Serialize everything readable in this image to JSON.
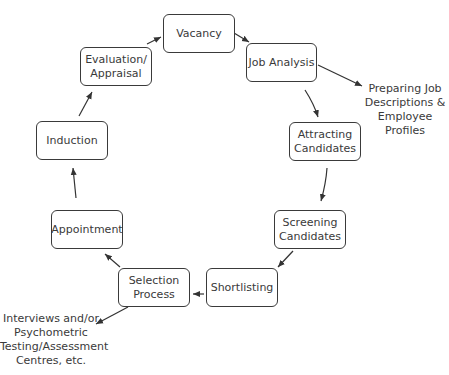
{
  "diagram": {
    "type": "cycle",
    "nodes": [
      {
        "id": "vacancy",
        "label": "Vacancy"
      },
      {
        "id": "job-analysis",
        "label": "Job Analysis"
      },
      {
        "id": "attracting-candidates",
        "label": "Attracting\nCandidates"
      },
      {
        "id": "screening-candidates",
        "label": "Screening\nCandidates"
      },
      {
        "id": "shortlisting",
        "label": "Shortlisting"
      },
      {
        "id": "selection-process",
        "label": "Selection\nProcess"
      },
      {
        "id": "appointment",
        "label": "Appointment"
      },
      {
        "id": "induction",
        "label": "Induction"
      },
      {
        "id": "evaluation-appraisal",
        "label": "Evaluation/\nAppraisal"
      }
    ],
    "notes": [
      {
        "id": "job-descriptions-note",
        "label": "Preparing Job\nDescriptions &\nEmployee\nProfiles",
        "attached_to": "job-analysis"
      },
      {
        "id": "selection-methods-note",
        "label": "Interviews and/or\nPsychometric\nTesting/Assessment\nCentres, etc.",
        "attached_to": "selection-process"
      }
    ],
    "edges": [
      [
        "vacancy",
        "job-analysis"
      ],
      [
        "job-analysis",
        "attracting-candidates"
      ],
      [
        "attracting-candidates",
        "screening-candidates"
      ],
      [
        "screening-candidates",
        "shortlisting"
      ],
      [
        "shortlisting",
        "selection-process"
      ],
      [
        "selection-process",
        "appointment"
      ],
      [
        "appointment",
        "induction"
      ],
      [
        "induction",
        "evaluation-appraisal"
      ],
      [
        "evaluation-appraisal",
        "vacancy"
      ],
      [
        "job-analysis",
        "job-descriptions-note"
      ],
      [
        "selection-process",
        "selection-methods-note"
      ]
    ]
  }
}
